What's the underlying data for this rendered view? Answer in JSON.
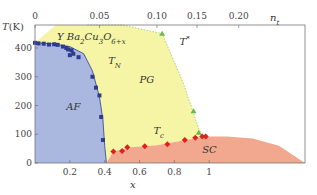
{
  "chart_data": {
    "type": "area",
    "title": "Y Ba2Cu3O6+x",
    "title_parts": {
      "main": "Y Ba",
      "sub1": "2",
      "mid": "Cu",
      "sub2": "3",
      "mid2": "O",
      "sub3": "6+x"
    },
    "xlabel": "x",
    "ylabel": "T(K)",
    "top_xlabel": "n_t",
    "top_xlabel_main": "n",
    "top_xlabel_sub": "t",
    "xlim": [
      0,
      1.55
    ],
    "ylim": [
      0,
      480
    ],
    "grid": false,
    "xticks": [
      {
        "v": 0.2,
        "label": "0.2"
      },
      {
        "v": 0.4,
        "label": "0.4"
      },
      {
        "v": 0.6,
        "label": "0.6"
      },
      {
        "v": 0.8,
        "label": "0.8"
      },
      {
        "v": 1.0,
        "label": "1"
      }
    ],
    "yticks": [
      {
        "v": 0,
        "label": "0"
      },
      {
        "v": 100,
        "label": "100"
      },
      {
        "v": 200,
        "label": "200"
      },
      {
        "v": 300,
        "label": "300"
      },
      {
        "v": 400,
        "label": "400"
      }
    ],
    "top_xticks": [
      {
        "x": 0.0,
        "label": "0"
      },
      {
        "x": 0.37,
        "label": "0.05"
      },
      {
        "x": 0.7,
        "label": "0.10"
      },
      {
        "x": 0.93,
        "label": "0.15"
      },
      {
        "x": 1.17,
        "label": "0.20"
      }
    ],
    "regions": [
      {
        "name": "AF",
        "label": "AF",
        "color": "#aab8e0"
      },
      {
        "name": "PG",
        "label": "PG",
        "color": "#f6f5a6"
      },
      {
        "name": "SC",
        "label": "SC",
        "color": "#f2a88e"
      }
    ],
    "curve_labels": [
      {
        "name": "T_N",
        "main": "T",
        "sub": "N",
        "x": 0.42,
        "y": 345
      },
      {
        "name": "T*",
        "main": "T",
        "sup": "*",
        "x": 0.83,
        "y": 410
      },
      {
        "name": "T_c",
        "main": "T",
        "sub": "c",
        "x": 0.68,
        "y": 100
      },
      {
        "name": "PG",
        "main": "PG",
        "x": 0.6,
        "y": 280
      },
      {
        "name": "AF",
        "main": "AF",
        "x": 0.18,
        "y": 185
      },
      {
        "name": "SC",
        "main": "SC",
        "x": 0.96,
        "y": 35
      }
    ],
    "series": [
      {
        "name": "T_N (AF)",
        "marker": "square",
        "color": "#2c3b8c",
        "x": [
          0.0,
          0.02,
          0.05,
          0.08,
          0.11,
          0.13,
          0.16,
          0.18,
          0.19,
          0.21,
          0.22,
          0.2,
          0.25,
          0.33,
          0.35,
          0.37,
          0.38,
          0.39
        ],
        "y": [
          418,
          416,
          415,
          412,
          413,
          411,
          405,
          400,
          395,
          392,
          380,
          375,
          368,
          300,
          262,
          235,
          160,
          80
        ]
      },
      {
        "name": "T*",
        "marker": "triangle",
        "color": "#6cb84a",
        "x": [
          0.73,
          0.91,
          0.94
        ],
        "y": [
          450,
          180,
          105
        ]
      },
      {
        "name": "T_c",
        "marker": "diamond",
        "color": "#e0201c",
        "x": [
          0.45,
          0.5,
          0.53,
          0.63,
          0.76,
          0.86,
          0.92,
          0.96,
          0.98
        ],
        "y": [
          40,
          42,
          55,
          58,
          65,
          80,
          88,
          92,
          92
        ]
      }
    ],
    "boundaries": {
      "af_x": [
        0,
        0.1,
        0.2,
        0.28,
        0.33,
        0.37,
        0.39,
        0.4,
        0.41
      ],
      "af_y": [
        418,
        415,
        405,
        380,
        320,
        230,
        150,
        60,
        0
      ],
      "tstar_x": [
        0.3,
        0.5,
        0.73,
        0.85,
        0.94,
        0.99
      ],
      "tstar_y": [
        480,
        480,
        450,
        280,
        120,
        60
      ],
      "sc_x": [
        0.41,
        0.45,
        0.55,
        0.7,
        0.85,
        0.98,
        1.1,
        1.25,
        1.4,
        1.55
      ],
      "sc_y": [
        0,
        40,
        55,
        62,
        78,
        92,
        92,
        85,
        60,
        0
      ]
    }
  }
}
